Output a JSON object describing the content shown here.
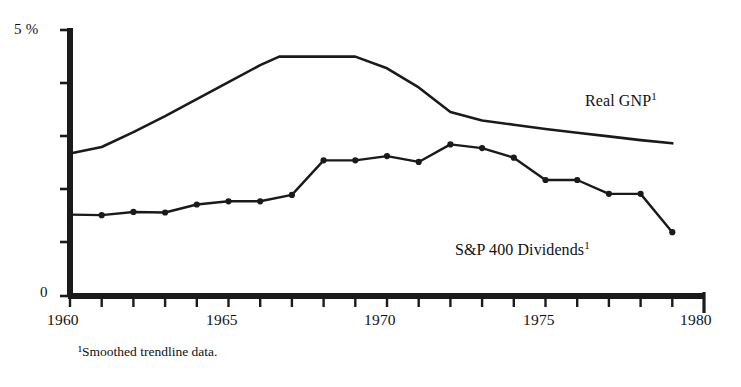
{
  "chart_data": {
    "type": "line",
    "title": "",
    "subtitle": "",
    "xlabel": "",
    "ylabel": "",
    "xlim": [
      1960,
      1980
    ],
    "ylim": [
      0,
      5
    ],
    "y_unit": "%",
    "grid": false,
    "legend_position": "inline-annotation",
    "x_tick_labels": [
      "1960",
      "1965",
      "1970",
      "1975",
      "1980"
    ],
    "x_tick_values": [
      1960,
      1965,
      1970,
      1975,
      1980
    ],
    "x_minor_tick_interval": 1,
    "y_tick_labels": [
      "0",
      "5 %"
    ],
    "y_tick_values": [
      0,
      5
    ],
    "y_minor_tick_values": [
      1,
      2,
      3,
      4
    ],
    "annotations": [
      {
        "name": "footnote",
        "text": "¹Smoothed trendline data."
      }
    ],
    "series": [
      {
        "name": "Real GNP¹",
        "label": "Real GNP",
        "superscript": "1",
        "marker": "none",
        "color": "#1a1a1a",
        "x": [
          1960.0,
          1961.0,
          1962.0,
          1963.0,
          1964.0,
          1965.0,
          1966.0,
          1966.6,
          1969.0,
          1970.0,
          1971.0,
          1972.0,
          1973.0,
          1974.0,
          1975.0,
          1976.0,
          1977.0,
          1978.0,
          1979.0
        ],
        "values": [
          2.68,
          2.8,
          3.08,
          3.38,
          3.7,
          4.02,
          4.34,
          4.5,
          4.5,
          4.28,
          3.92,
          3.46,
          3.3,
          3.22,
          3.14,
          3.07,
          3.0,
          2.93,
          2.87
        ]
      },
      {
        "name": "S&P 400 Dividends¹",
        "label": "S&P 400 Dividends",
        "superscript": "1",
        "marker": "circle",
        "color": "#1a1a1a",
        "x": [
          1960,
          1961,
          1962,
          1963,
          1964,
          1965,
          1966,
          1967,
          1968,
          1969,
          1970,
          1971,
          1972,
          1973,
          1974,
          1975,
          1976,
          1977,
          1978,
          1979
        ],
        "values": [
          1.53,
          1.52,
          1.58,
          1.57,
          1.72,
          1.78,
          1.78,
          1.9,
          2.55,
          2.55,
          2.63,
          2.52,
          2.85,
          2.78,
          2.6,
          2.18,
          2.18,
          1.92,
          1.92,
          1.2
        ]
      }
    ]
  },
  "axis": {
    "y_top_label": "5 %",
    "y_bottom_label": "0",
    "x_labels": {
      "y1960": "1960",
      "y1965": "1965",
      "y1970": "1970",
      "y1975": "1975",
      "y1980": "1980"
    }
  },
  "labels": {
    "gnp": "Real GNP",
    "gnp_sup": "1",
    "sp": "S&P 400 Dividends",
    "sp_sup": "1"
  },
  "footnote": {
    "text": "¹Smoothed trendline data."
  }
}
